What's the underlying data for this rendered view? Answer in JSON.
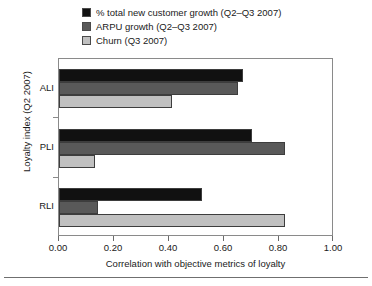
{
  "chart_data": {
    "type": "bar",
    "orientation": "horizontal",
    "title": "",
    "xlabel": "Correlation with objective metrics of loyalty",
    "ylabel": "Loyalty index (Q2 2007)",
    "categories": [
      "ALI",
      "PLI",
      "RLI"
    ],
    "xlim": [
      0.0,
      1.0
    ],
    "xticks": [
      0.0,
      0.2,
      0.4,
      0.6,
      0.8,
      1.0
    ],
    "xticklabels": [
      "0.00",
      "0.20",
      "0.40",
      "0.60",
      "0.80",
      "1.00"
    ],
    "grid": false,
    "legend_position": "above-plot-left",
    "series": [
      {
        "name": "% total new customer growth (Q2–Q3 2007)",
        "color": "#111111",
        "values": [
          0.67,
          0.7,
          0.52
        ]
      },
      {
        "name": "ARPU growth (Q2–Q3 2007)",
        "color": "#595959",
        "values": [
          0.65,
          0.82,
          0.14
        ]
      },
      {
        "name": "Churn (Q3 2007)",
        "color": "#c0c0c0",
        "values": [
          0.41,
          0.13,
          0.82
        ]
      }
    ]
  },
  "colors": {
    "series_black": "#111111",
    "series_dark_gray": "#595959",
    "series_light_gray": "#c0c0c0",
    "frame": "#8a8a8a",
    "text": "#1a1a1a",
    "rule": "#6f6f6f"
  }
}
